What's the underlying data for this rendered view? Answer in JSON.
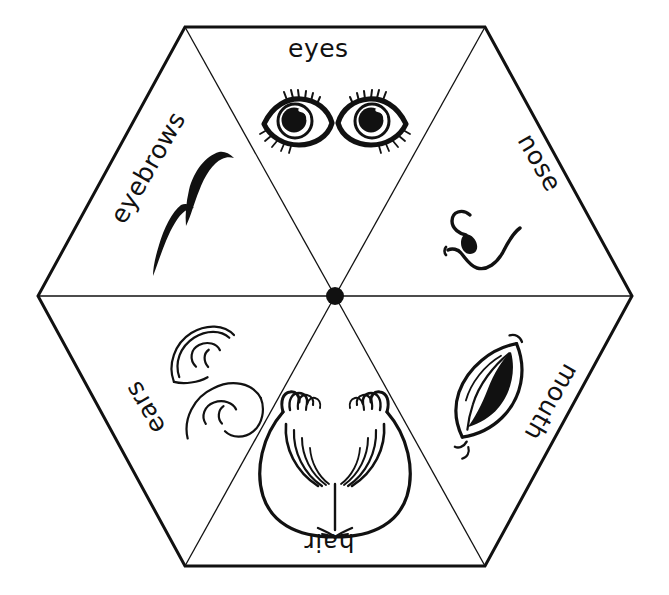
{
  "figure": {
    "kind": "face-parts-hexagon-wheel",
    "background_color": "#ffffff",
    "ink_color": "#111111",
    "shape": "hexagon",
    "sector_count": 6,
    "hub": {
      "name": "center-dot",
      "cx": 335,
      "cy": 296,
      "r": 9,
      "fill": "#111111"
    },
    "outline": {
      "stroke_width": 3,
      "vertices": [
        [
          185,
          27
        ],
        [
          485,
          27
        ],
        [
          632,
          296
        ],
        [
          485,
          566
        ],
        [
          185,
          566
        ],
        [
          38,
          296
        ]
      ]
    },
    "spokes": {
      "stroke_width": 1.3,
      "endpoints": [
        [
          185,
          27
        ],
        [
          485,
          27
        ],
        [
          632,
          296
        ],
        [
          485,
          566
        ],
        [
          185,
          566
        ],
        [
          38,
          296
        ]
      ]
    }
  },
  "sectors": [
    {
      "id": "eyes",
      "label": "eyes",
      "drawing": "eyes-drawing",
      "label_rotation_deg": 0,
      "label_left": 288,
      "label_top": 36,
      "position": "top"
    },
    {
      "id": "nose",
      "label": "nose",
      "drawing": "nose-drawing",
      "label_rotation_deg": 60,
      "label_left": 509,
      "label_top": 150,
      "position": "upper-right"
    },
    {
      "id": "mouth",
      "label": "mouth",
      "drawing": "mouth-drawing",
      "label_rotation_deg": 120,
      "label_left": 510,
      "label_top": 390,
      "position": "lower-right"
    },
    {
      "id": "hair",
      "label": "hair",
      "drawing": "hair-drawing",
      "label_rotation_deg": 180,
      "label_left": 304,
      "label_top": 530,
      "position": "bottom"
    },
    {
      "id": "ears",
      "label": "ears",
      "drawing": "ears-drawing",
      "label_rotation_deg": 240,
      "label_left": 117,
      "label_top": 395,
      "position": "lower-left"
    },
    {
      "id": "eyebrows",
      "label": "eyebrows",
      "drawing": "eyebrows-drawing",
      "label_rotation_deg": 300,
      "label_left": 86,
      "label_top": 155,
      "position": "upper-left"
    }
  ]
}
